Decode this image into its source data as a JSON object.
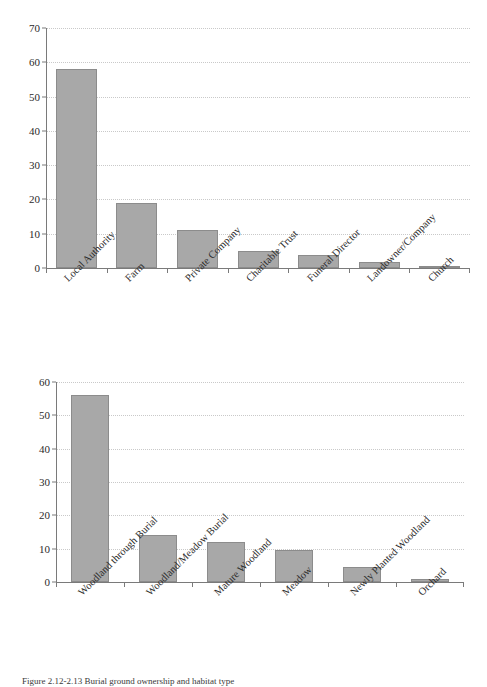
{
  "caption": {
    "text": "Figure 2.12-2.13 Burial ground ownership and habitat type"
  },
  "chart_data": [
    {
      "id": "ownership",
      "type": "bar",
      "title": "",
      "xlabel": "",
      "ylabel": "",
      "ylim": [
        0,
        70
      ],
      "yticks": [
        0,
        10,
        20,
        30,
        40,
        50,
        60,
        70
      ],
      "grid": true,
      "legend": false,
      "bar_color": "#a8a8a8",
      "categories": [
        "Local Authority",
        "Farm",
        "Private Company",
        "Charitable Trust",
        "Funeral Director",
        "Landowner/Company",
        "Church"
      ],
      "values": [
        58,
        19,
        11,
        5,
        3.7,
        1.8,
        0.5
      ]
    },
    {
      "id": "habitat",
      "type": "bar",
      "title": "",
      "xlabel": "",
      "ylabel": "",
      "ylim": [
        0,
        60
      ],
      "yticks": [
        0,
        10,
        20,
        30,
        40,
        50,
        60
      ],
      "grid": true,
      "legend": false,
      "bar_color": "#a8a8a8",
      "categories": [
        "Woodland through Burial",
        "Woodland/Meadow Burial",
        "Mature Woodland",
        "Meadow",
        "Newly Planted Woodland",
        "Orchard"
      ],
      "values": [
        56,
        14,
        12,
        9.5,
        4.5,
        1
      ]
    }
  ]
}
